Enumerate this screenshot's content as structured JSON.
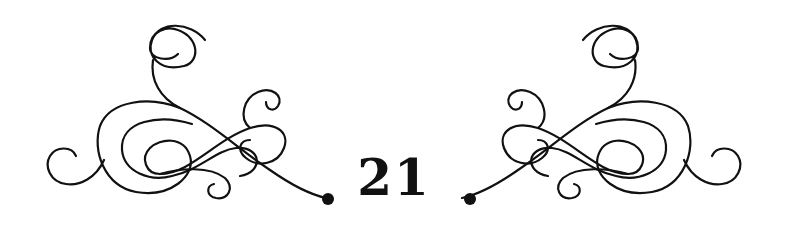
{
  "chapter": {
    "number_label": "21",
    "ink_color": "#111111",
    "background_color": "#ffffff"
  },
  "ornament": {
    "left_flourish": "scroll-flourish-left",
    "right_flourish": "scroll-flourish-right"
  }
}
